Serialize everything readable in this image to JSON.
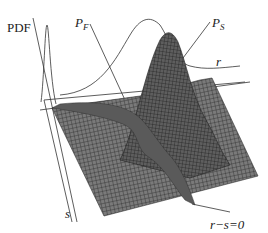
{
  "figure": {
    "type": "3d-surface-diagram",
    "labels": {
      "pdf_axis": "PDF",
      "pf_main": "P",
      "pf_sub": "F",
      "ps_main": "P",
      "ps_sub": "S",
      "r_axis": "r",
      "s_axis": "s",
      "limit_state": "r−s 0"
    },
    "limit_state_text": "r−s=0",
    "colors": {
      "surface_fill": "#6e6e6e",
      "surface_grid": "#2a2a2a",
      "failure_region": "#5a5a5a",
      "axis_lines": "#333333",
      "background": "#ffffff"
    }
  }
}
